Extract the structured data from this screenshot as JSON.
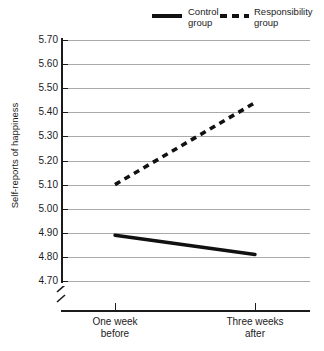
{
  "chart_data": {
    "type": "line",
    "title": "",
    "xlabel": "",
    "ylabel": "Self-reports of happiness",
    "categories": [
      "One week before",
      "Three weeks after"
    ],
    "ylim": [
      4.7,
      5.7
    ],
    "ytick_step": 0.1,
    "ytick_labels": [
      "5.70",
      "5.60",
      "5.50",
      "5.40",
      "5.30",
      "5.20",
      "5.10",
      "5.00",
      "4.90",
      "4.80",
      "4.70"
    ],
    "ytick_values": [
      5.7,
      5.6,
      5.5,
      5.4,
      5.3,
      5.2,
      5.1,
      5.0,
      4.9,
      4.8,
      4.7
    ],
    "grid": true,
    "axis_break": true,
    "legend_position": "top-right",
    "series": [
      {
        "name": "Control group",
        "style": "solid",
        "color": "#111111",
        "values": [
          4.89,
          4.81
        ]
      },
      {
        "name": "Responsibility group",
        "style": "dashed",
        "color": "#111111",
        "values": [
          5.1,
          5.44
        ]
      }
    ]
  },
  "legend": {
    "entries": [
      {
        "label_line1": "Control",
        "label_line2": "group",
        "style": "solid"
      },
      {
        "label_line1": "Responsibility",
        "label_line2": "group",
        "style": "dashed"
      }
    ]
  },
  "axes": {
    "y_title": "Self-reports of happiness",
    "x_categories": [
      {
        "line1": "One week",
        "line2": "before"
      },
      {
        "line1": "Three weeks",
        "line2": "after"
      }
    ]
  },
  "colors": {
    "gridline": "#a9a9a9",
    "axis": "#1b1b1b",
    "series": "#111111",
    "background": "#ffffff"
  }
}
